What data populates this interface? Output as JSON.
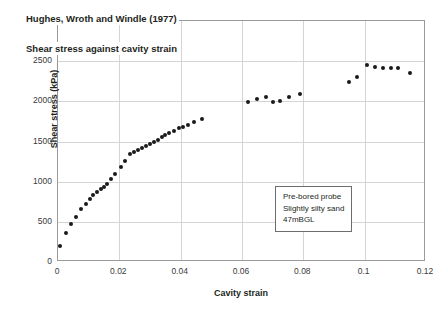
{
  "chart_data": {
    "type": "scatter",
    "title": "Hughes, Wroth and Windle (1977)",
    "subtitle": "Shear stress against cavity strain",
    "xlabel": "Cavity strain",
    "ylabel": "Shear stress (kPa)",
    "xlim": [
      0,
      0.12
    ],
    "ylim": [
      0,
      3000
    ],
    "xticks": [
      0,
      0.02,
      0.04,
      0.06,
      0.08,
      0.1,
      0.12
    ],
    "xticklabels": [
      "0",
      "0.02",
      "0.04",
      "0.06",
      "0.08",
      "0.1",
      "0.12"
    ],
    "yticks": [
      0,
      500,
      1000,
      1500,
      2000,
      2500,
      3000
    ],
    "yticklabels": [
      "0",
      "500",
      "1000",
      "1500",
      "2000",
      "2500",
      "3000"
    ],
    "grid": true,
    "legend": false,
    "marker": "filled-circle",
    "marker_color": "#1a1a1a",
    "series": [
      {
        "name": "Shear stress",
        "points": [
          [
            0.0005,
            200
          ],
          [
            0.0025,
            355
          ],
          [
            0.0042,
            470
          ],
          [
            0.006,
            560
          ],
          [
            0.0075,
            660
          ],
          [
            0.009,
            725
          ],
          [
            0.0103,
            790
          ],
          [
            0.0115,
            830
          ],
          [
            0.0128,
            870
          ],
          [
            0.014,
            905
          ],
          [
            0.015,
            935
          ],
          [
            0.016,
            975
          ],
          [
            0.0172,
            1030
          ],
          [
            0.0185,
            1090
          ],
          [
            0.0205,
            1180
          ],
          [
            0.0218,
            1255
          ],
          [
            0.0235,
            1350
          ],
          [
            0.0248,
            1365
          ],
          [
            0.0262,
            1400
          ],
          [
            0.0275,
            1420
          ],
          [
            0.0288,
            1450
          ],
          [
            0.03,
            1470
          ],
          [
            0.0313,
            1500
          ],
          [
            0.0325,
            1520
          ],
          [
            0.0338,
            1555
          ],
          [
            0.035,
            1585
          ],
          [
            0.0363,
            1605
          ],
          [
            0.0378,
            1635
          ],
          [
            0.0393,
            1665
          ],
          [
            0.0408,
            1675
          ],
          [
            0.0425,
            1700
          ],
          [
            0.0443,
            1740
          ],
          [
            0.047,
            1780
          ],
          [
            0.062,
            1990
          ],
          [
            0.065,
            2025
          ],
          [
            0.0678,
            2055
          ],
          [
            0.0702,
            1995
          ],
          [
            0.0725,
            2010
          ],
          [
            0.0752,
            2050
          ],
          [
            0.079,
            2090
          ],
          [
            0.095,
            2240
          ],
          [
            0.0975,
            2300
          ],
          [
            0.1008,
            2450
          ],
          [
            0.1035,
            2430
          ],
          [
            0.106,
            2420
          ],
          [
            0.1085,
            2415
          ],
          [
            0.111,
            2410
          ],
          [
            0.1148,
            2355
          ]
        ]
      }
    ],
    "annotation": {
      "lines": [
        "Pre-bored probe",
        "Slightly silty sand",
        "47mBGL"
      ]
    }
  }
}
